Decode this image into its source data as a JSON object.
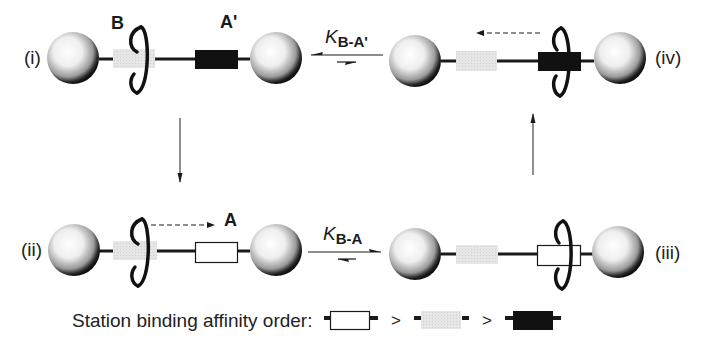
{
  "diagram": {
    "type": "molecular-shuttle-cycle",
    "states": [
      {
        "id": "i",
        "label": "(i)",
        "ring_at": "B",
        "right_station": "A'",
        "right_station_type": "black"
      },
      {
        "id": "ii",
        "label": "(ii)",
        "ring_at": "B",
        "right_station": "A",
        "right_station_type": "white",
        "motion": "ring moves toward A"
      },
      {
        "id": "iii",
        "label": "(iii)",
        "ring_at": "A",
        "right_station_type": "white"
      },
      {
        "id": "iv",
        "label": "(iv)",
        "ring_at": "A'",
        "right_station_type": "black",
        "motion": "ring moves toward B"
      }
    ],
    "station_labels": {
      "B": "B",
      "A_prime": "A'",
      "A": "A"
    },
    "equilibria": [
      {
        "between": [
          "i",
          "iv"
        ],
        "k_symbol": "K",
        "k_subscript": "B-A'"
      },
      {
        "between": [
          "ii",
          "iii"
        ],
        "k_symbol": "K",
        "k_subscript": "B-A"
      }
    ],
    "transitions": [
      {
        "from": "i",
        "to": "ii",
        "direction": "down"
      },
      {
        "from": "iii",
        "to": "iv",
        "direction": "up"
      }
    ],
    "legend": {
      "text": "Station binding affinity order:",
      "order": [
        "white station (A)",
        "gray station (B)",
        "black station (A')"
      ],
      "separator": ">"
    },
    "colors": {
      "station_black": "#111111",
      "station_gray": "#e2e2e2",
      "station_white": "#ffffff",
      "line": "#1a1a1a"
    }
  }
}
